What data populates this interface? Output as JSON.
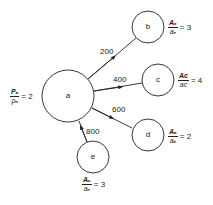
{
  "diagram": {
    "type": "flow-network",
    "colors": {
      "stroke": "#222222",
      "background": "#ffffff"
    },
    "nodes": [
      {
        "id": "a",
        "label": "a",
        "cx": 68,
        "cy": 96,
        "r": 27
      },
      {
        "id": "b",
        "label": "b",
        "cx": 148,
        "cy": 27,
        "r": 16
      },
      {
        "id": "c",
        "label": "c",
        "cx": 158,
        "cy": 80,
        "r": 16
      },
      {
        "id": "d",
        "label": "d",
        "cx": 148,
        "cy": 135,
        "r": 16
      },
      {
        "id": "e",
        "label": "e",
        "cx": 93,
        "cy": 157,
        "r": 16
      }
    ],
    "edges": [
      {
        "from": "a",
        "to": "b",
        "label": "200"
      },
      {
        "from": "a",
        "to": "c",
        "label": "400"
      },
      {
        "from": "d",
        "to": "a",
        "label": "600"
      },
      {
        "from": "e",
        "to": "a",
        "label": "800"
      }
    ],
    "annotations": {
      "a": {
        "num": "Pₐ",
        "den": "ρₐ",
        "eq": "= 2"
      },
      "b": {
        "num": "Aₑ",
        "den": "aₑ",
        "eq": "= 3"
      },
      "c": {
        "num": "Aᴄ",
        "den": "aᴄ",
        "eq": "= 4"
      },
      "d": {
        "num": "Aₔ",
        "den": "aₔ",
        "eq": "= 2"
      },
      "e": {
        "num": "Aₑ",
        "den": "aₑ",
        "eq": "= 3"
      }
    }
  }
}
